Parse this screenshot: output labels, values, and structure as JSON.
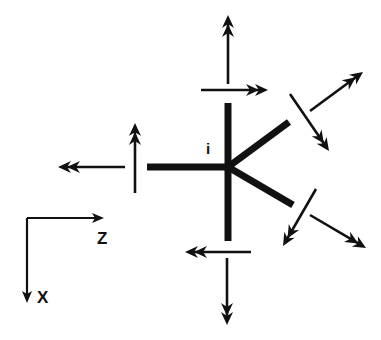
{
  "diagram": {
    "type": "bond-displacement vector diagram",
    "center_label": "i",
    "axes": {
      "horizontal": "Z",
      "vertical": "X"
    },
    "colors": {
      "ink": "#111111",
      "background": "#ffffff"
    },
    "bonds": [
      {
        "id": "bond-up",
        "from": [
          228,
          167
        ],
        "to": [
          228,
          103
        ]
      },
      {
        "id": "bond-down",
        "from": [
          228,
          167
        ],
        "to": [
          228,
          241
        ]
      },
      {
        "id": "bond-left",
        "from": [
          228,
          167
        ],
        "to": [
          147,
          167
        ]
      },
      {
        "id": "bond-upper-right",
        "from": [
          228,
          167
        ],
        "to": [
          289,
          122
        ]
      },
      {
        "id": "bond-lower-right",
        "from": [
          228,
          167
        ],
        "to": [
          293,
          205
        ]
      }
    ],
    "arrows": [
      {
        "id": "top-vertical",
        "from": [
          228,
          84
        ],
        "to": [
          228,
          15
        ]
      },
      {
        "id": "top-horizontal",
        "from": [
          201,
          90
        ],
        "to": [
          268,
          90
        ]
      },
      {
        "id": "left-horizontal",
        "from": [
          125,
          167
        ],
        "to": [
          58,
          167
        ]
      },
      {
        "id": "left-vertical",
        "from": [
          135,
          193
        ],
        "to": [
          135,
          123
        ]
      },
      {
        "id": "bottom-horizontal",
        "from": [
          251,
          252
        ],
        "to": [
          185,
          252
        ]
      },
      {
        "id": "bottom-vertical",
        "from": [
          227,
          258
        ],
        "to": [
          227,
          325
        ]
      },
      {
        "id": "upper-right-outward",
        "from": [
          310,
          111
        ],
        "to": [
          363,
          72
        ]
      },
      {
        "id": "upper-right-transverse",
        "from": [
          290,
          94
        ],
        "to": [
          329,
          151
        ]
      },
      {
        "id": "lower-right-transverse",
        "from": [
          316,
          189
        ],
        "to": [
          283,
          246
        ]
      },
      {
        "id": "lower-right-outward",
        "from": [
          310,
          215
        ],
        "to": [
          366,
          248
        ]
      }
    ]
  }
}
